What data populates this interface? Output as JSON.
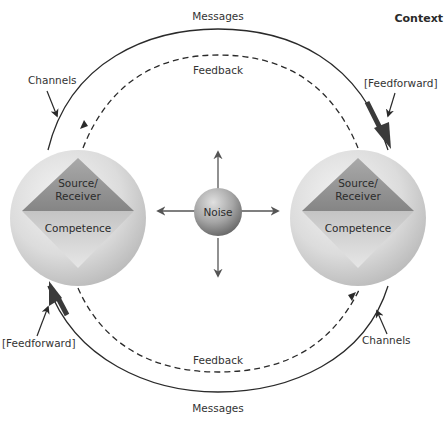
{
  "diagram": {
    "title": "Context",
    "nodes": {
      "left": {
        "top_label_line1": "Source/",
        "top_label_line2": "Receiver",
        "bottom_label": "Competence"
      },
      "right": {
        "top_label_line1": "Source/",
        "top_label_line2": "Receiver",
        "bottom_label": "Competence"
      },
      "center": {
        "label": "Noise"
      }
    },
    "flows": {
      "messages_top": "Messages",
      "messages_bottom": "Messages",
      "feedback_top": "Feedback",
      "feedback_bottom": "Feedback"
    },
    "annotations": {
      "channels_top_left": "Channels",
      "channels_bottom_right": "Channels",
      "feedforward_top_right": "[Feedforward]",
      "feedforward_bottom_left": "[Feedforward]"
    },
    "colors": {
      "line": "#2a2a2a",
      "sphere_light": "#f2f2f2",
      "sphere_dark": "#b8b8b8",
      "diamond_top": "#8e8e8e",
      "diamond_bottom": "#cfcfcf",
      "noise_light": "#d8d8d8",
      "noise_dark": "#6e6e6e"
    }
  }
}
